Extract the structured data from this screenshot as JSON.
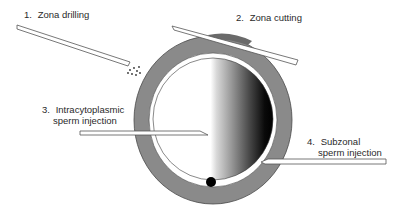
{
  "diagram": {
    "labels": [
      {
        "number": "1.",
        "text": "Zona drilling",
        "line2": ""
      },
      {
        "number": "2.",
        "text": "Zona cutting",
        "line2": ""
      },
      {
        "number": "3.",
        "text": "Intracytoplasmic",
        "line2": "sperm injection"
      },
      {
        "number": "4.",
        "text": "Subzonal",
        "line2": "sperm injection"
      }
    ],
    "parts": {
      "zona_pellucida": "zona-pellucida",
      "oocyte": "oocyte",
      "polar_body": "polar-body",
      "perivitelline_space": "perivitelline-space"
    },
    "colors": {
      "zona": "#8a8a8a",
      "zona_outline": "#4a4a4a",
      "oocyte_light": "#ffffff",
      "oocyte_dark": "#050505",
      "polar_body": "#000000",
      "pipette_fill": "#ffffff",
      "pipette_stroke": "#555555",
      "text": "#2a2a2a"
    }
  }
}
